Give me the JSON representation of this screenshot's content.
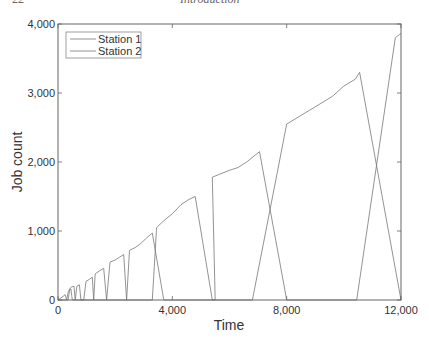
{
  "page_header": {
    "page_number": "22",
    "running_title": "Introduction"
  },
  "chart_data": {
    "type": "line",
    "title": "",
    "xlabel": "Time",
    "ylabel": "Job count",
    "xlim": [
      0,
      12000
    ],
    "ylim": [
      0,
      4000
    ],
    "xticks": [
      0,
      4000,
      8000,
      12000
    ],
    "xtick_labels": [
      "0",
      "4,000",
      "8,000",
      "12,000"
    ],
    "yticks": [
      0,
      1000,
      2000,
      3000,
      4000
    ],
    "ytick_labels": [
      "0",
      "1,000",
      "2,000",
      "3,000",
      "4,000"
    ],
    "grid": false,
    "legend_position": "upper left",
    "legend": [
      "Station 1",
      "Station 2"
    ],
    "series": [
      {
        "name": "Station 1",
        "color": "#777777",
        "points": [
          [
            0,
            0
          ],
          [
            100,
            30
          ],
          [
            200,
            60
          ],
          [
            250,
            80
          ],
          [
            300,
            0
          ],
          [
            350,
            0
          ],
          [
            420,
            170
          ],
          [
            480,
            190
          ],
          [
            560,
            200
          ],
          [
            600,
            0
          ],
          [
            900,
            0
          ],
          [
            980,
            270
          ],
          [
            1100,
            300
          ],
          [
            1200,
            330
          ],
          [
            1250,
            0
          ],
          [
            1700,
            0
          ],
          [
            1820,
            550
          ],
          [
            2000,
            580
          ],
          [
            2150,
            620
          ],
          [
            2300,
            660
          ],
          [
            2400,
            0
          ],
          [
            3300,
            0
          ],
          [
            3450,
            1050
          ],
          [
            3700,
            1150
          ],
          [
            4000,
            1250
          ],
          [
            4300,
            1380
          ],
          [
            4550,
            1450
          ],
          [
            4800,
            1500
          ],
          [
            5400,
            0
          ],
          [
            6800,
            0
          ],
          [
            8000,
            2550
          ],
          [
            8400,
            2650
          ],
          [
            8800,
            2750
          ],
          [
            9200,
            2850
          ],
          [
            9600,
            2950
          ],
          [
            10000,
            3100
          ],
          [
            10400,
            3200
          ],
          [
            10550,
            3300
          ],
          [
            12000,
            0
          ]
        ]
      },
      {
        "name": "Station 2",
        "color": "#777777",
        "points": [
          [
            0,
            0
          ],
          [
            300,
            0
          ],
          [
            360,
            120
          ],
          [
            400,
            150
          ],
          [
            450,
            160
          ],
          [
            500,
            0
          ],
          [
            600,
            0
          ],
          [
            660,
            200
          ],
          [
            750,
            220
          ],
          [
            800,
            0
          ],
          [
            1250,
            0
          ],
          [
            1300,
            380
          ],
          [
            1450,
            420
          ],
          [
            1600,
            460
          ],
          [
            1700,
            0
          ],
          [
            2400,
            0
          ],
          [
            2500,
            720
          ],
          [
            2700,
            760
          ],
          [
            2900,
            820
          ],
          [
            3100,
            900
          ],
          [
            3300,
            970
          ],
          [
            3700,
            0
          ],
          [
            5400,
            0
          ],
          [
            5500,
            0
          ],
          [
            5400,
            1780
          ],
          [
            5700,
            1830
          ],
          [
            6000,
            1880
          ],
          [
            6300,
            1920
          ],
          [
            6600,
            2000
          ],
          [
            6900,
            2100
          ],
          [
            7050,
            2150
          ],
          [
            8000,
            0
          ],
          [
            10450,
            0
          ],
          [
            11800,
            3800
          ],
          [
            11950,
            3850
          ],
          [
            12000,
            3860
          ]
        ]
      }
    ],
    "peaks": [
      {
        "time": 300,
        "value": 90
      },
      {
        "time": 600,
        "value": 200
      },
      {
        "time": 900,
        "value": 220
      },
      {
        "time": 1250,
        "value": 330
      },
      {
        "time": 1700,
        "value": 460
      },
      {
        "time": 2400,
        "value": 660
      },
      {
        "time": 3300,
        "value": 970
      },
      {
        "time": 4800,
        "value": 1500
      },
      {
        "time": 7050,
        "value": 2150
      },
      {
        "time": 10550,
        "value": 3300
      },
      {
        "time": 12000,
        "value": 3860
      }
    ]
  }
}
